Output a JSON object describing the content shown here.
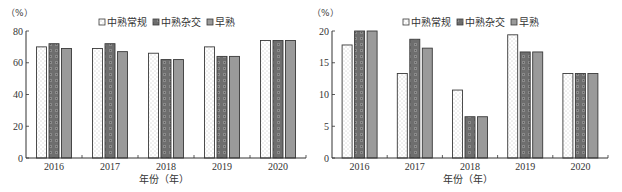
{
  "chart_data": [
    {
      "type": "bar",
      "title": "",
      "unit_label": "（%）",
      "xlabel": "年份（年）",
      "ylabel": "%",
      "ylim": [
        0,
        80
      ],
      "yticks": [
        0,
        20,
        40,
        60,
        80
      ],
      "categories": [
        "2016",
        "2017",
        "2018",
        "2019",
        "2020"
      ],
      "legend_position": "top",
      "grid": false,
      "series": [
        {
          "name": "中熟常规",
          "pattern": "dotted-white",
          "values": [
            70,
            69,
            66,
            70,
            74
          ]
        },
        {
          "name": "中熟杂交",
          "pattern": "checker-dark",
          "values": [
            72,
            72,
            62,
            64,
            74
          ]
        },
        {
          "name": "早熟",
          "pattern": "solid-gray",
          "values": [
            69,
            67,
            62,
            64,
            74
          ]
        }
      ]
    },
    {
      "type": "bar",
      "title": "",
      "unit_label": "（%）",
      "xlabel": "年份（年）",
      "ylabel": "%",
      "ylim": [
        0,
        20
      ],
      "yticks": [
        0,
        5,
        10,
        15,
        20
      ],
      "categories": [
        "2016",
        "2017",
        "2018",
        "2019",
        "2020"
      ],
      "legend_position": "top",
      "grid": false,
      "series": [
        {
          "name": "中熟常规",
          "pattern": "dotted-white",
          "values": [
            17.8,
            13.3,
            10.7,
            19.4,
            13.3
          ]
        },
        {
          "name": "中熟杂交",
          "pattern": "checker-dark",
          "values": [
            20.0,
            18.7,
            6.5,
            16.7,
            13.3
          ]
        },
        {
          "name": "早熟",
          "pattern": "solid-gray",
          "values": [
            20.0,
            17.3,
            6.5,
            16.7,
            13.3
          ]
        }
      ]
    }
  ],
  "colors": {
    "regular_fill": "#ffffff",
    "hybrid_fill": "#6e6e6e",
    "early_fill": "#9a9a9a",
    "outline": "#3a3a3a",
    "axis": "#333333"
  }
}
